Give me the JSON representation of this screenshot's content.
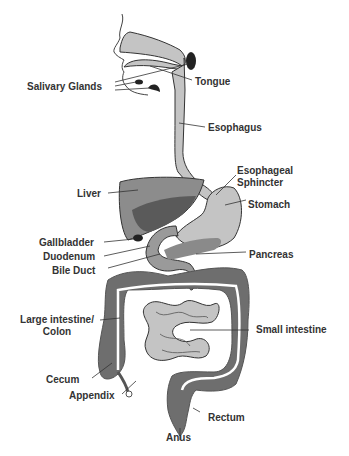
{
  "diagram": {
    "colors": {
      "organ_light": "#c4c4c4",
      "organ_mid": "#9a9a9a",
      "organ_dark": "#6e6e6e",
      "gland": "#222222",
      "line": "#333333",
      "text": "#333333"
    },
    "labels": {
      "salivary_glands": "Salivary Glands",
      "tongue": "Tongue",
      "esophagus": "Esophagus",
      "esophageal_sphincter_1": "Esophageal",
      "esophageal_sphincter_2": "Sphincter",
      "liver": "Liver",
      "stomach": "Stomach",
      "gallbladder": "Gallbladder",
      "duodenum": "Duodenum",
      "bile_duct": "Bile Duct",
      "pancreas": "Pancreas",
      "large_intestine_1": "Large intestine/",
      "large_intestine_2": "Colon",
      "small_intestine": "Small intestine",
      "cecum": "Cecum",
      "appendix": "Appendix",
      "rectum": "Rectum",
      "anus": "Anus"
    }
  }
}
